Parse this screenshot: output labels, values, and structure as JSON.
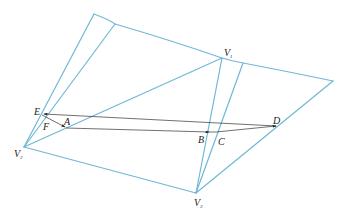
{
  "diagram": {
    "type": "folded-surface-geodesic",
    "colors": {
      "edge": "#6fb8d4",
      "ray": "#333333",
      "label": "#222222"
    },
    "vertices": {
      "V1": {
        "label": "V",
        "sub": "1"
      },
      "V2": {
        "label": "V",
        "sub": "2"
      },
      "V3": {
        "label": "V",
        "sub": "3"
      }
    },
    "points": {
      "E": "E",
      "F": "F",
      "A": "A",
      "B": "B",
      "C": "C",
      "D": "D"
    }
  }
}
